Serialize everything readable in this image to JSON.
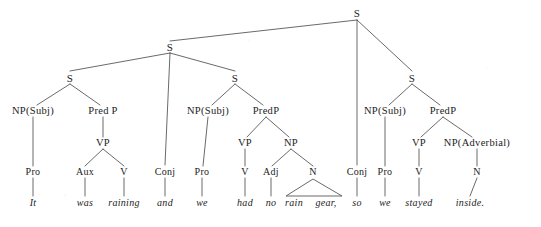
{
  "diagram": {
    "type": "syntax-tree",
    "sentence": "It was raining and we had no rain gear, so we stayed inside.",
    "line_color": "#444444",
    "text_color": "#1a1a1a",
    "background_color": "#ffffff",
    "nodes": [
      {
        "id": "root",
        "label": "S",
        "x": 357,
        "y": 13,
        "kind": "s-node"
      },
      {
        "id": "s-left-top",
        "label": "S",
        "x": 170,
        "y": 47,
        "kind": "s-node"
      },
      {
        "id": "s1",
        "label": "S",
        "x": 70,
        "y": 78,
        "kind": "s-node"
      },
      {
        "id": "s2",
        "label": "S",
        "x": 235,
        "y": 78,
        "kind": "s-node"
      },
      {
        "id": "s3",
        "label": "S",
        "x": 412,
        "y": 78,
        "kind": "s-node"
      },
      {
        "id": "np1",
        "label": "NP(Subj)",
        "x": 33,
        "y": 111,
        "kind": "cat"
      },
      {
        "id": "predp1",
        "label": "Pred P",
        "x": 103,
        "y": 111,
        "kind": "cat"
      },
      {
        "id": "np2",
        "label": "NP(Subj)",
        "x": 208,
        "y": 111,
        "kind": "cat"
      },
      {
        "id": "predp2",
        "label": "PredP",
        "x": 266,
        "y": 111,
        "kind": "cat"
      },
      {
        "id": "np3",
        "label": "NP(Subj)",
        "x": 385,
        "y": 111,
        "kind": "cat"
      },
      {
        "id": "predp3",
        "label": "PredP",
        "x": 443,
        "y": 111,
        "kind": "cat"
      },
      {
        "id": "vp1",
        "label": "VP",
        "x": 103,
        "y": 143,
        "kind": "cat"
      },
      {
        "id": "vp2",
        "label": "VP",
        "x": 245,
        "y": 143,
        "kind": "cat"
      },
      {
        "id": "np-obj",
        "label": "NP",
        "x": 291,
        "y": 143,
        "kind": "cat"
      },
      {
        "id": "vp3",
        "label": "VP",
        "x": 419,
        "y": 143,
        "kind": "cat"
      },
      {
        "id": "np-adv",
        "label": "NP(Adverbial)",
        "x": 477,
        "y": 143,
        "kind": "cat"
      },
      {
        "id": "pro1",
        "label": "Pro",
        "x": 33,
        "y": 172,
        "kind": "pos"
      },
      {
        "id": "aux1",
        "label": "Aux",
        "x": 85,
        "y": 172,
        "kind": "pos"
      },
      {
        "id": "v1",
        "label": "V",
        "x": 124,
        "y": 172,
        "kind": "pos"
      },
      {
        "id": "conj1",
        "label": "Conj",
        "x": 165,
        "y": 172,
        "kind": "pos"
      },
      {
        "id": "pro2",
        "label": "Pro",
        "x": 202,
        "y": 172,
        "kind": "pos"
      },
      {
        "id": "v2",
        "label": "V",
        "x": 245,
        "y": 172,
        "kind": "pos"
      },
      {
        "id": "adj1",
        "label": "Adj",
        "x": 271,
        "y": 172,
        "kind": "pos"
      },
      {
        "id": "n1",
        "label": "N",
        "x": 313,
        "y": 172,
        "kind": "pos"
      },
      {
        "id": "conj2",
        "label": "Conj",
        "x": 357,
        "y": 172,
        "kind": "pos"
      },
      {
        "id": "pro3",
        "label": "Pro",
        "x": 385,
        "y": 172,
        "kind": "pos"
      },
      {
        "id": "v3",
        "label": "V",
        "x": 419,
        "y": 172,
        "kind": "pos"
      },
      {
        "id": "n2",
        "label": "N",
        "x": 477,
        "y": 172,
        "kind": "pos"
      },
      {
        "id": "w-it",
        "label": "It",
        "x": 33,
        "y": 203,
        "kind": "word"
      },
      {
        "id": "w-was",
        "label": "was",
        "x": 85,
        "y": 203,
        "kind": "word"
      },
      {
        "id": "w-raining",
        "label": "raining",
        "x": 124,
        "y": 203,
        "kind": "word"
      },
      {
        "id": "w-and",
        "label": "and",
        "x": 165,
        "y": 203,
        "kind": "word"
      },
      {
        "id": "w-we1",
        "label": "we",
        "x": 202,
        "y": 203,
        "kind": "word"
      },
      {
        "id": "w-had",
        "label": "had",
        "x": 245,
        "y": 203,
        "kind": "word"
      },
      {
        "id": "w-no",
        "label": "no",
        "x": 271,
        "y": 203,
        "kind": "word"
      },
      {
        "id": "w-rain",
        "label": "rain",
        "x": 294,
        "y": 203,
        "kind": "word"
      },
      {
        "id": "w-gear",
        "label": "gear,",
        "x": 326,
        "y": 203,
        "kind": "word"
      },
      {
        "id": "w-so",
        "label": "so",
        "x": 357,
        "y": 203,
        "kind": "word"
      },
      {
        "id": "w-we2",
        "label": "we",
        "x": 385,
        "y": 203,
        "kind": "word"
      },
      {
        "id": "w-stayed",
        "label": "stayed",
        "x": 419,
        "y": 203,
        "kind": "word"
      },
      {
        "id": "w-inside",
        "label": "inside.",
        "x": 470,
        "y": 203,
        "kind": "word"
      }
    ],
    "edges": [
      {
        "from": "root",
        "to": "s-left-top",
        "x1": 357,
        "y1": 20,
        "x2": 170,
        "y2": 41
      },
      {
        "from": "root",
        "to": "conj2",
        "x1": 357,
        "y1": 20,
        "x2": 357,
        "y2": 165
      },
      {
        "from": "root",
        "to": "s3",
        "x1": 357,
        "y1": 20,
        "x2": 412,
        "y2": 71
      },
      {
        "from": "s-left-top",
        "to": "s1",
        "x1": 170,
        "y1": 53,
        "x2": 70,
        "y2": 71
      },
      {
        "from": "s-left-top",
        "to": "conj1",
        "x1": 170,
        "y1": 53,
        "x2": 165,
        "y2": 165
      },
      {
        "from": "s-left-top",
        "to": "s2",
        "x1": 170,
        "y1": 53,
        "x2": 235,
        "y2": 71
      },
      {
        "from": "s1",
        "to": "np1",
        "x1": 70,
        "y1": 84,
        "x2": 37,
        "y2": 105
      },
      {
        "from": "s1",
        "to": "predp1",
        "x1": 70,
        "y1": 84,
        "x2": 100,
        "y2": 105
      },
      {
        "from": "s2",
        "to": "np2",
        "x1": 235,
        "y1": 84,
        "x2": 212,
        "y2": 105
      },
      {
        "from": "s2",
        "to": "predp2",
        "x1": 235,
        "y1": 84,
        "x2": 263,
        "y2": 105
      },
      {
        "from": "s3",
        "to": "np3",
        "x1": 412,
        "y1": 84,
        "x2": 389,
        "y2": 105
      },
      {
        "from": "s3",
        "to": "predp3",
        "x1": 412,
        "y1": 84,
        "x2": 440,
        "y2": 105
      },
      {
        "from": "np1",
        "to": "pro1",
        "x1": 33,
        "y1": 117,
        "x2": 33,
        "y2": 166
      },
      {
        "from": "predp1",
        "to": "vp1",
        "x1": 103,
        "y1": 117,
        "x2": 103,
        "y2": 137
      },
      {
        "from": "vp1",
        "to": "aux1",
        "x1": 103,
        "y1": 149,
        "x2": 85,
        "y2": 166
      },
      {
        "from": "vp1",
        "to": "v1",
        "x1": 103,
        "y1": 149,
        "x2": 124,
        "y2": 166
      },
      {
        "from": "np2",
        "to": "pro2",
        "x1": 208,
        "y1": 117,
        "x2": 203,
        "y2": 166
      },
      {
        "from": "predp2",
        "to": "vp2",
        "x1": 266,
        "y1": 117,
        "x2": 247,
        "y2": 137
      },
      {
        "from": "predp2",
        "to": "np-obj",
        "x1": 266,
        "y1": 117,
        "x2": 289,
        "y2": 137
      },
      {
        "from": "vp2",
        "to": "v2",
        "x1": 245,
        "y1": 149,
        "x2": 245,
        "y2": 166
      },
      {
        "from": "np-obj",
        "to": "adj1",
        "x1": 291,
        "y1": 149,
        "x2": 272,
        "y2": 166
      },
      {
        "from": "np-obj",
        "to": "n1",
        "x1": 291,
        "y1": 149,
        "x2": 313,
        "y2": 166
      },
      {
        "from": "np3",
        "to": "pro3",
        "x1": 385,
        "y1": 117,
        "x2": 385,
        "y2": 166
      },
      {
        "from": "predp3",
        "to": "vp3",
        "x1": 443,
        "y1": 117,
        "x2": 421,
        "y2": 137
      },
      {
        "from": "predp3",
        "to": "np-adv",
        "x1": 443,
        "y1": 117,
        "x2": 472,
        "y2": 137
      },
      {
        "from": "vp3",
        "to": "v3",
        "x1": 419,
        "y1": 149,
        "x2": 419,
        "y2": 166
      },
      {
        "from": "np-adv",
        "to": "n2",
        "x1": 477,
        "y1": 149,
        "x2": 477,
        "y2": 166
      },
      {
        "from": "pro1",
        "to": "w-it",
        "x1": 33,
        "y1": 178,
        "x2": 33,
        "y2": 196
      },
      {
        "from": "aux1",
        "to": "w-was",
        "x1": 85,
        "y1": 178,
        "x2": 85,
        "y2": 196
      },
      {
        "from": "v1",
        "to": "w-raining",
        "x1": 124,
        "y1": 178,
        "x2": 124,
        "y2": 196
      },
      {
        "from": "conj1",
        "to": "w-and",
        "x1": 165,
        "y1": 178,
        "x2": 165,
        "y2": 196
      },
      {
        "from": "pro2",
        "to": "w-we1",
        "x1": 202,
        "y1": 178,
        "x2": 202,
        "y2": 196
      },
      {
        "from": "v2",
        "to": "w-had",
        "x1": 245,
        "y1": 178,
        "x2": 245,
        "y2": 196
      },
      {
        "from": "adj1",
        "to": "w-no",
        "x1": 271,
        "y1": 178,
        "x2": 271,
        "y2": 196
      },
      {
        "from": "conj2",
        "to": "w-so",
        "x1": 357,
        "y1": 178,
        "x2": 357,
        "y2": 196
      },
      {
        "from": "pro3",
        "to": "w-we2",
        "x1": 385,
        "y1": 178,
        "x2": 385,
        "y2": 196
      },
      {
        "from": "v3",
        "to": "w-stayed",
        "x1": 419,
        "y1": 178,
        "x2": 419,
        "y2": 196
      },
      {
        "from": "n2",
        "to": "w-inside",
        "x1": 477,
        "y1": 178,
        "x2": 470,
        "y2": 196
      }
    ],
    "triangles": [
      {
        "id": "tri-rain-gear",
        "from": "n1",
        "apex_x": 313,
        "apex_y": 179,
        "left_x": 286,
        "right_x": 342,
        "base_y": 196
      }
    ]
  }
}
